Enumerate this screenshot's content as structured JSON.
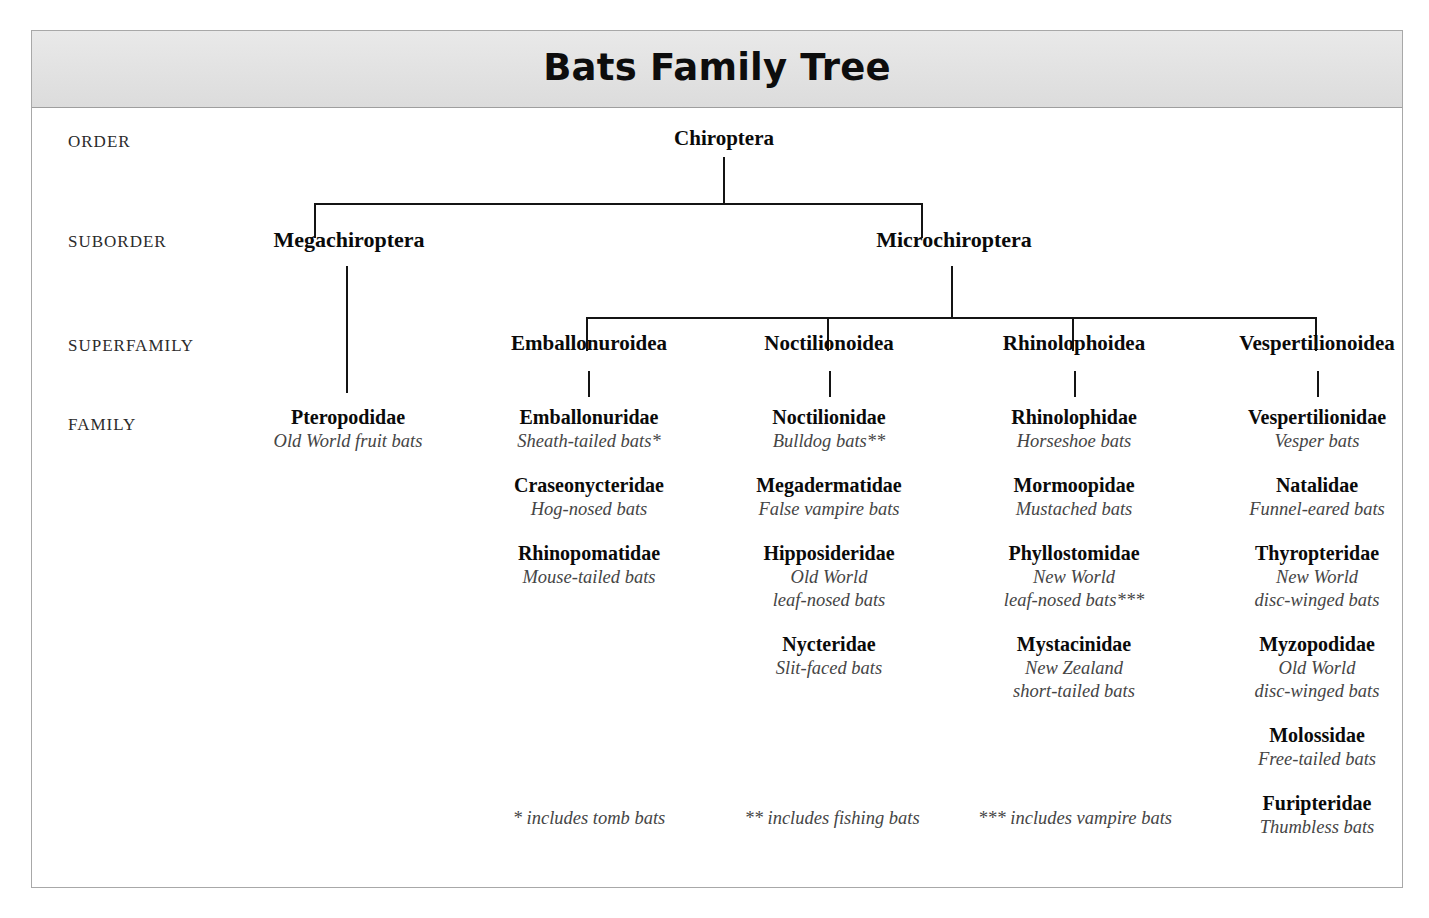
{
  "title": "Bats Family Tree",
  "rank_labels": [
    {
      "label": "ORDER"
    },
    {
      "label": "SUBORDER"
    },
    {
      "label": "SUPERFAMILY"
    },
    {
      "label": "FAMILY"
    }
  ],
  "order": {
    "name": "Chiroptera"
  },
  "suborders": [
    {
      "name": "Megachiroptera"
    },
    {
      "name": "Microchiroptera"
    }
  ],
  "superfamilies": [
    {
      "name": "Emballonuroidea"
    },
    {
      "name": "Noctilionoidea"
    },
    {
      "name": "Rhinolophoidea"
    },
    {
      "name": "Vespertilionoidea"
    }
  ],
  "families": {
    "pteropodidae_column": [
      {
        "name": "Pteropodidae",
        "common": "Old World fruit bats"
      }
    ],
    "emballonuroidea_column": [
      {
        "name": "Emballonuridae",
        "common": "Sheath-tailed bats*"
      },
      {
        "name": "Craseonycteridae",
        "common": "Hog-nosed bats"
      },
      {
        "name": "Rhinopomatidae",
        "common": "Mouse-tailed bats"
      }
    ],
    "noctilionoidea_column": [
      {
        "name": "Noctilionidae",
        "common": "Bulldog bats**"
      },
      {
        "name": "Megadermatidae",
        "common": "False vampire bats"
      },
      {
        "name": "Hipposideridae",
        "common": "Old World",
        "common2": "leaf-nosed bats"
      },
      {
        "name": "Nycteridae",
        "common": "Slit-faced bats"
      }
    ],
    "rhinolophoidea_column": [
      {
        "name": "Rhinolophidae",
        "common": "Horseshoe bats"
      },
      {
        "name": "Mormoopidae",
        "common": "Mustached bats"
      },
      {
        "name": "Phyllostomidae",
        "common": "New World",
        "common2": "leaf-nosed bats***"
      },
      {
        "name": "Mystacinidae",
        "common": "New Zealand",
        "common2": "short-tailed bats"
      }
    ],
    "vespertilionoidea_column": [
      {
        "name": "Vespertilionidae",
        "common": "Vesper bats"
      },
      {
        "name": "Natalidae",
        "common": "Funnel-eared bats"
      },
      {
        "name": "Thyropteridae",
        "common": "New World",
        "common2": "disc-winged bats"
      },
      {
        "name": "Myzopodidae",
        "common": "Old World",
        "common2": "disc-winged bats"
      },
      {
        "name": "Molossidae",
        "common": "Free-tailed bats"
      },
      {
        "name": "Furipteridae",
        "common": "Thumbless bats"
      }
    ]
  },
  "footnotes": [
    {
      "text": "* includes tomb bats"
    },
    {
      "text": "** includes fishing bats"
    },
    {
      "text": "*** includes vampire bats"
    }
  ],
  "colors": {
    "line": "#141414",
    "title_band": "#e3e3e3",
    "frame_border": "#a8a8a8",
    "common_name": "#454545"
  }
}
